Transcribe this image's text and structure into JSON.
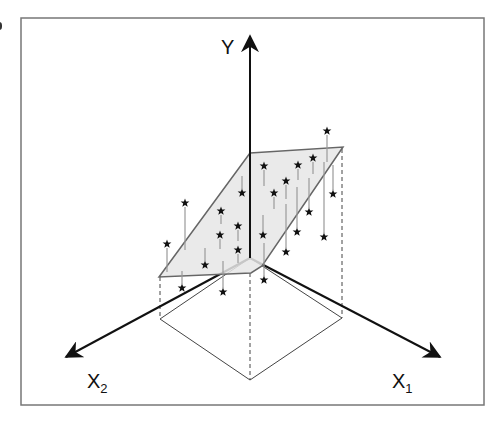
{
  "figure": {
    "frame": {
      "x": 21,
      "y": 18,
      "width": 463,
      "height": 387,
      "stroke": "#777777"
    },
    "colors": {
      "axis": "#111111",
      "plane_fill": "#e6e6e6",
      "plane_edge": "#666666",
      "residual": "#999999",
      "dashed": "#444444",
      "star": "#111111"
    },
    "axes": {
      "y": {
        "label": "Y",
        "from": [
          250,
          258
        ],
        "to": [
          250,
          36
        ]
      },
      "x1": {
        "label": "X",
        "sub": "1",
        "from": [
          250,
          258
        ],
        "to": [
          440,
          357
        ]
      },
      "x2": {
        "label": "X",
        "sub": "2",
        "from": [
          250,
          258
        ],
        "to": [
          66,
          357
        ]
      }
    },
    "plane": {
      "points": [
        [
          250,
          153
        ],
        [
          343,
          147
        ],
        [
          262,
          266
        ],
        [
          251,
          273
        ],
        [
          159,
          277
        ]
      ]
    },
    "floor_projection": {
      "points": [
        [
          250,
          258
        ],
        [
          342,
          318
        ],
        [
          250,
          380
        ],
        [
          160,
          319
        ]
      ]
    },
    "dashed_verticals": [
      {
        "x": 160,
        "y1": 277,
        "y2": 319
      },
      {
        "x": 250,
        "y1": 273,
        "y2": 380
      },
      {
        "x": 342,
        "y1": 149,
        "y2": 318
      }
    ],
    "points": [
      {
        "x": 327,
        "y": 131,
        "ly1": 135,
        "ly2": 162
      },
      {
        "x": 264,
        "y": 166,
        "ly1": 170,
        "ly2": 186
      },
      {
        "x": 298,
        "y": 165,
        "ly1": 169,
        "ly2": 180
      },
      {
        "x": 313,
        "y": 158,
        "ly1": 162,
        "ly2": 174
      },
      {
        "x": 286,
        "y": 181,
        "ly1": 185,
        "ly2": 199
      },
      {
        "x": 274,
        "y": 193,
        "ly1": 197,
        "ly2": 209
      },
      {
        "x": 242,
        "y": 193,
        "ly1": 176,
        "ly2": 189
      },
      {
        "x": 185,
        "y": 203,
        "ly1": 207,
        "ly2": 250
      },
      {
        "x": 221,
        "y": 211,
        "ly1": 215,
        "ly2": 224
      },
      {
        "x": 333,
        "y": 194,
        "ly1": 165,
        "ly2": 190
      },
      {
        "x": 309,
        "y": 212,
        "ly1": 178,
        "ly2": 208
      },
      {
        "x": 238,
        "y": 226,
        "ly1": 230,
        "ly2": 241
      },
      {
        "x": 220,
        "y": 235,
        "ly1": 239,
        "ly2": 249
      },
      {
        "x": 263,
        "y": 235,
        "ly1": 215,
        "ly2": 231
      },
      {
        "x": 297,
        "y": 232,
        "ly1": 187,
        "ly2": 228
      },
      {
        "x": 324,
        "y": 237,
        "ly1": 162,
        "ly2": 233
      },
      {
        "x": 167,
        "y": 244,
        "ly1": 248,
        "ly2": 272
      },
      {
        "x": 238,
        "y": 250,
        "ly1": 254,
        "ly2": 263
      },
      {
        "x": 205,
        "y": 265,
        "ly1": 248,
        "ly2": 261
      },
      {
        "x": 286,
        "y": 252,
        "ly1": 204,
        "ly2": 248
      },
      {
        "x": 264,
        "y": 280,
        "ly1": 243,
        "ly2": 276
      },
      {
        "x": 182,
        "y": 288,
        "ly1": 271,
        "ly2": 284
      },
      {
        "x": 223,
        "y": 292,
        "ly1": 261,
        "ly2": 288
      }
    ]
  }
}
